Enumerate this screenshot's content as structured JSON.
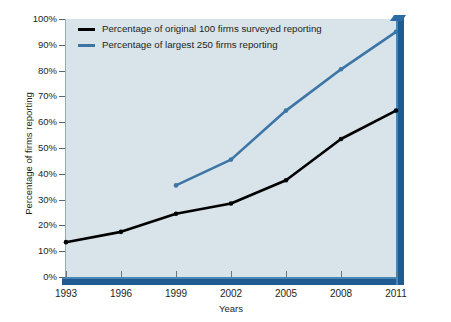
{
  "chart_data": {
    "type": "line",
    "title": "",
    "xlabel": "Years",
    "ylabel": "Percentage of firms reporting",
    "categories": [
      "1993",
      "1996",
      "1999",
      "2002",
      "2005",
      "2008",
      "2011"
    ],
    "x": [
      1993,
      1996,
      1999,
      2002,
      2005,
      2008,
      2011
    ],
    "xlim": [
      1993,
      2011
    ],
    "ylim": [
      0,
      100
    ],
    "ytick_labels": [
      "0%",
      "10%",
      "20%",
      "30%",
      "40%",
      "50%",
      "60%",
      "70%",
      "80%",
      "90%",
      "100%"
    ],
    "ytick_values": [
      0,
      10,
      20,
      30,
      40,
      50,
      60,
      70,
      80,
      90,
      100
    ],
    "grid": false,
    "legend_position": "top-left",
    "series": [
      {
        "name": "Percentage of original 100 firms surveyed reporting",
        "color": "#000000",
        "values": [
          13.5,
          17.5,
          24.5,
          28.5,
          37.5,
          53.5,
          64.5
        ],
        "markers": true
      },
      {
        "name": "Percentage of largest 250 firms reporting",
        "color": "#3d76a6",
        "values": [
          null,
          null,
          35.5,
          45.5,
          64.5,
          80.5,
          95.0
        ],
        "markers": true
      }
    ],
    "plot_background": "#d8e3ea",
    "axis_color": "#1d5b92"
  },
  "legend": {
    "entries": [
      {
        "label": "Percentage of original 100 firms surveyed reporting",
        "color": "#000000"
      },
      {
        "label": "Percentage of largest 250 firms reporting",
        "color": "#3d76a6"
      }
    ]
  },
  "axes": {
    "y_title": "Percentage of firms reporting",
    "x_title": "Years",
    "y_labels": [
      "100%",
      "90%",
      "80%",
      "70%",
      "60%",
      "50%",
      "40%",
      "30%",
      "20%",
      "10%",
      "0%"
    ],
    "x_labels": [
      "1993",
      "1996",
      "1999",
      "2002",
      "2005",
      "2008",
      "2011"
    ]
  }
}
